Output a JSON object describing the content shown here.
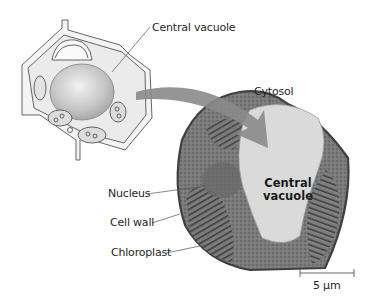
{
  "figure": {
    "labels": {
      "central_vacuole_drawing": "Central vacuole",
      "cytosol": "Cytosol",
      "nucleus": "Nucleus",
      "cell_wall": "Cell wall",
      "chloroplast": "Chloroplast",
      "central_vacuole_micrograph_line1": "Central",
      "central_vacuole_micrograph_line2": "vacuole"
    },
    "scale_bar": {
      "label": "5 µm"
    },
    "colors": {
      "arrow": "#8a8a8a",
      "vacuole_micrograph": "#d9d9d9",
      "cytoplasm": "#6e6e6e",
      "cell_outline": "#4a4a4a",
      "drawing_vacuole": "#c8c8c8"
    }
  }
}
